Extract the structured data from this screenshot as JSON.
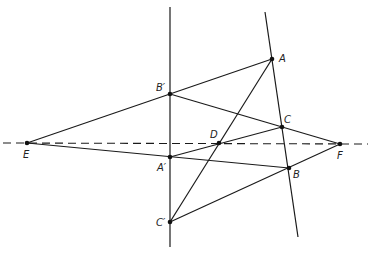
{
  "diagram": {
    "title": "",
    "points": {
      "A": {
        "label": "A",
        "x": 272,
        "y": 59,
        "lx": 279,
        "ly": 62
      },
      "B'": {
        "label": "B′",
        "x": 170,
        "y": 94,
        "lx": 156,
        "ly": 91
      },
      "C": {
        "label": "C",
        "x": 282,
        "y": 127,
        "lx": 284,
        "ly": 123
      },
      "D": {
        "label": "D",
        "x": 219,
        "y": 143,
        "lx": 210,
        "ly": 138
      },
      "E": {
        "label": "E",
        "x": 27,
        "y": 143,
        "lx": 23,
        "ly": 158
      },
      "F": {
        "label": "F",
        "x": 340,
        "y": 144,
        "lx": 337,
        "ly": 159
      },
      "A'": {
        "label": "A′",
        "x": 170,
        "y": 157,
        "lx": 157,
        "ly": 171
      },
      "B": {
        "label": "B",
        "x": 289,
        "y": 168,
        "lx": 293,
        "ly": 178
      },
      "C'": {
        "label": "C′",
        "x": 170,
        "y": 222,
        "lx": 156,
        "ly": 226
      }
    },
    "labels": [
      "A",
      "B′",
      "C",
      "D",
      "E",
      "F",
      "A′",
      "B",
      "C′"
    ],
    "lines": [
      {
        "name": "vertical-line-a-prime-b-prime-c-prime",
        "x1": 170,
        "y1": 7,
        "x2": 170,
        "y2": 247
      },
      {
        "name": "line-a-c-b",
        "x1": 265,
        "y1": 12,
        "x2": 298,
        "y2": 237
      },
      {
        "name": "segment-e-a",
        "x1": 27,
        "y1": 143,
        "x2": 272,
        "y2": 59
      },
      {
        "name": "segment-b-prime-f",
        "x1": 170,
        "y1": 94,
        "x2": 340,
        "y2": 144
      },
      {
        "name": "segment-e-b",
        "x1": 27,
        "y1": 143,
        "x2": 289,
        "y2": 168
      },
      {
        "name": "segment-a-prime-c",
        "x1": 170,
        "y1": 157,
        "x2": 282,
        "y2": 127
      },
      {
        "name": "segment-c-prime-a",
        "x1": 170,
        "y1": 222,
        "x2": 272,
        "y2": 59
      },
      {
        "name": "segment-c-prime-f",
        "x1": 170,
        "y1": 222,
        "x2": 340,
        "y2": 144
      }
    ],
    "dashed_line": {
      "name": "dashed-line-e-d-f",
      "x1": 3,
      "y1": 143,
      "x2": 368,
      "y2": 144
    }
  }
}
